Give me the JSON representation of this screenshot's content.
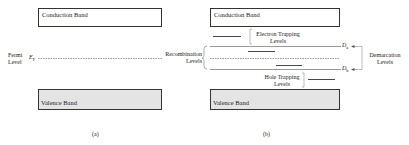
{
  "panel_a": {
    "conduction_band": "Conduction Band",
    "valence_band": "Valence Band",
    "fermi_label_line1": "Fermi",
    "fermi_label_line2": "Level",
    "fermi_symbol": "E",
    "fermi_symbol_sub": "F",
    "caption": "(a)"
  },
  "panel_b": {
    "conduction_band": "Conduction Band",
    "valence_band": "Valence Band",
    "electron_trapping_line1": "Electron Trapping",
    "electron_trapping_line2": "Levels",
    "hole_trapping_line1": "Hole Trapping",
    "hole_trapping_line2": "Levels",
    "recombination_line1": "Recombination",
    "recombination_line2": "Levels",
    "demarcation_line1": "Demarcation",
    "demarcation_line2": "Levels",
    "da_symbol": "D",
    "da_sub": "a",
    "db_symbol": "D",
    "db_sub": "b",
    "caption": "(b)"
  },
  "colors": {
    "line": "#333333",
    "valence_fill": "#e4e4e4"
  }
}
